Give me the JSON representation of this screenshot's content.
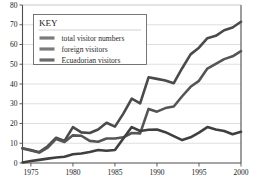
{
  "chart_data": {
    "type": "line",
    "title": "",
    "subtitle": "",
    "xlabel": "",
    "ylabel": "",
    "xlim": [
      1974,
      2000
    ],
    "ylim": [
      0,
      80
    ],
    "grid": true,
    "grid_axis": "y",
    "legend_position": "top-left",
    "legend_title": "KEY",
    "x_ticks": [
      "1975",
      "1980",
      "1985",
      "1990",
      "1995",
      "2000"
    ],
    "x_tick_values": [
      1975,
      1980,
      1985,
      1990,
      1995,
      2000
    ],
    "y_ticks": [
      "0",
      "10",
      "20",
      "30",
      "40",
      "50",
      "60",
      "70",
      "80"
    ],
    "y_tick_values": [
      0,
      10,
      20,
      30,
      40,
      50,
      60,
      70,
      80
    ],
    "x": [
      1974,
      1975,
      1976,
      1977,
      1978,
      1979,
      1980,
      1981,
      1982,
      1983,
      1984,
      1985,
      1986,
      1987,
      1988,
      1989,
      1990,
      1991,
      1992,
      1993,
      1994,
      1995,
      1996,
      1997,
      1998,
      1999,
      2000
    ],
    "series": [
      {
        "name": "total visitor numbers",
        "color": "#4a4a4a",
        "values": [
          7.5,
          6.6,
          5.5,
          8.5,
          12.8,
          11.2,
          18.2,
          15.5,
          15.2,
          17.0,
          20.4,
          18.4,
          25.0,
          32.6,
          30.2,
          43.4,
          42.6,
          41.8,
          40.4,
          48.0,
          55.0,
          58.4,
          63.2,
          64.4,
          67.2,
          68.6,
          71.5
        ]
      },
      {
        "name": "foreign visitors",
        "color": "#555555",
        "values": [
          7.3,
          6.3,
          5.3,
          7.8,
          12.2,
          10.6,
          14.0,
          13.8,
          11.2,
          10.8,
          12.4,
          12.4,
          13.0,
          15.2,
          15.0,
          27.4,
          26.0,
          27.8,
          28.6,
          33.8,
          38.6,
          41.6,
          47.8,
          50.2,
          52.6,
          54.0,
          56.6
        ]
      },
      {
        "name": "Ecuadorian visitors",
        "color": "#3f3f3f",
        "values": [
          0.3,
          1.0,
          1.6,
          2.2,
          2.8,
          3.2,
          4.4,
          4.8,
          5.6,
          6.6,
          6.2,
          6.6,
          12.4,
          18.2,
          16.2,
          16.8,
          17.0,
          15.6,
          13.6,
          11.6,
          13.0,
          15.4,
          18.2,
          17.0,
          16.2,
          14.6,
          15.8
        ]
      }
    ]
  },
  "legend": {
    "title": "KEY",
    "items": [
      {
        "label": "total visitor numbers",
        "swatch_color": "#7a7a7a"
      },
      {
        "label": "foreign visitors",
        "swatch_color": "#7a7a7a"
      },
      {
        "label": "Ecuadorian visitors",
        "swatch_color": "#6a6a6a"
      }
    ]
  },
  "colors": {
    "background": "#ffffff",
    "grid": "#c9c9c9",
    "axis": "#4d4d4d",
    "text": "#1a1a1a"
  }
}
